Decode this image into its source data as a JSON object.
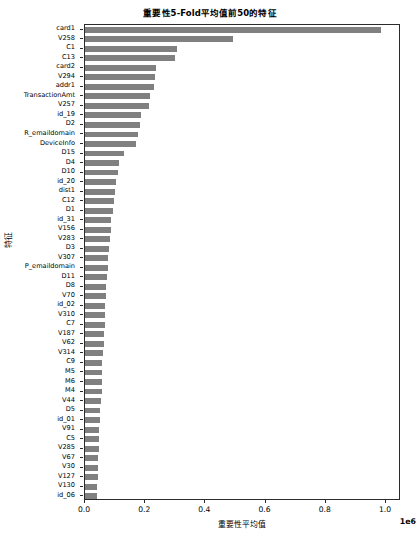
{
  "chart_data": {
    "type": "bar",
    "orientation": "horizontal",
    "title": "重要性5-Fold平均值前50的特征",
    "xlabel": "重要性平均值",
    "ylabel": "特征",
    "x_offset_text": "1e6",
    "xlim": [
      0,
      1050000
    ],
    "xticks": [
      0.0,
      0.2,
      0.4,
      0.6,
      0.8,
      1.0
    ],
    "xtick_labels": [
      "0.0",
      "0.2",
      "0.4",
      "0.6",
      "0.8",
      "1.0"
    ],
    "grid": false,
    "legend": "none",
    "bar_color": "#808080",
    "categories": [
      "card1",
      "V258",
      "C1",
      "C13",
      "card2",
      "V294",
      "addr1",
      "TransactionAmt",
      "V257",
      "id_19",
      "D2",
      "R_emaildomain",
      "DeviceInfo",
      "D15",
      "D4",
      "D10",
      "id_20",
      "dist1",
      "C12",
      "D1",
      "id_31",
      "V156",
      "V283",
      "D3",
      "V307",
      "P_emaildomain",
      "D11",
      "D8",
      "V70",
      "id_02",
      "V310",
      "C7",
      "V187",
      "V62",
      "V314",
      "C9",
      "M5",
      "M6",
      "M4",
      "V44",
      "D5",
      "id_01",
      "V91",
      "C5",
      "V285",
      "V67",
      "V30",
      "V127",
      "V130",
      "id_06"
    ],
    "values": [
      985000,
      492000,
      307000,
      300000,
      235000,
      232000,
      230000,
      215000,
      212000,
      185000,
      182000,
      175000,
      170000,
      130000,
      112000,
      108000,
      104000,
      100000,
      95000,
      92000,
      88000,
      85000,
      82000,
      80000,
      78000,
      75000,
      73000,
      71000,
      69000,
      67000,
      66000,
      65000,
      63000,
      62000,
      60000,
      58000,
      57000,
      56000,
      55000,
      53000,
      51000,
      49000,
      47000,
      46000,
      45000,
      44000,
      43000,
      42000,
      41000,
      40000
    ]
  }
}
